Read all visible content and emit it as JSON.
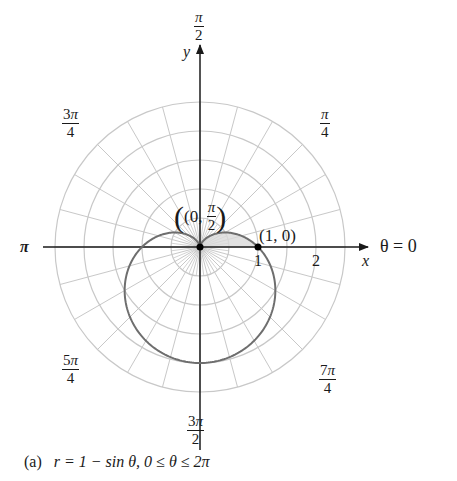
{
  "figure": {
    "caption_label": "(a)",
    "caption_equation": "r = 1 − sin θ, 0 ≤ θ ≤ 2π",
    "angle_labels": {
      "top": {
        "num_digit": "",
        "num_pi": "π",
        "den": "2"
      },
      "top_left": {
        "num_digit": "3",
        "num_pi": "π",
        "den": "4"
      },
      "top_right": {
        "num_digit": "",
        "num_pi": "π",
        "den": "4"
      },
      "left": "π",
      "right": "θ = 0",
      "bottom_left": {
        "num_digit": "5",
        "num_pi": "π",
        "den": "4"
      },
      "bottom_right": {
        "num_digit": "7",
        "num_pi": "π",
        "den": "4"
      },
      "bottom": {
        "num_digit": "3",
        "num_pi": "π",
        "den": "2"
      }
    },
    "axis_labels": {
      "x": "x",
      "y": "y"
    },
    "tick_labels": [
      "1",
      "2"
    ],
    "points": [
      {
        "label_open": "(0, ",
        "label_num": "π",
        "label_den": "2",
        "label_close": ")",
        "r": 0,
        "theta": "π/2"
      },
      {
        "label": "(1, 0)",
        "r": 1,
        "theta": "0"
      }
    ],
    "colors": {
      "curve": "#6e6e6e",
      "grid": "#c8c8c8",
      "axis": "#1a1a1a",
      "shade": "#d9d9d9",
      "point": "#000000"
    }
  },
  "chart_data": {
    "type": "polar",
    "equation": "r = 1 - sin(theta)",
    "theta_range": [
      0,
      6.2832
    ],
    "r_grid": [
      0.5,
      1.0,
      1.5,
      2.0,
      2.5
    ],
    "angular_grid_step_deg": 15,
    "angle_tick_labels": [
      "θ = 0",
      "π/4",
      "π/2",
      "3π/4",
      "π",
      "5π/4",
      "3π/2",
      "7π/4"
    ],
    "xlabel": "x",
    "ylabel": "y",
    "x_ticks": [
      1,
      2
    ],
    "marked_points": [
      {
        "label": "(0, π/2)",
        "r": 0,
        "theta": 1.5708
      },
      {
        "label": "(1, 0)",
        "r": 1,
        "theta": 0
      }
    ],
    "shaded_region": {
      "description": "region between curve and polar axis for 0 ≤ θ ≤ π/2",
      "theta_range": [
        0,
        1.5708
      ]
    },
    "sample_points": [
      {
        "theta": 0,
        "r": 1.0
      },
      {
        "theta": 0.7854,
        "r": 0.293
      },
      {
        "theta": 1.5708,
        "r": 0.0
      },
      {
        "theta": 2.3562,
        "r": 0.293
      },
      {
        "theta": 3.1416,
        "r": 1.0
      },
      {
        "theta": 3.927,
        "r": 1.707
      },
      {
        "theta": 4.7124,
        "r": 2.0
      },
      {
        "theta": 5.4978,
        "r": 1.707
      },
      {
        "theta": 6.2832,
        "r": 1.0
      }
    ],
    "grid": true,
    "legend": null
  }
}
